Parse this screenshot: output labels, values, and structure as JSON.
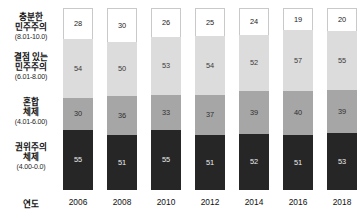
{
  "chart_data": {
    "type": "bar",
    "subtype": "stacked-vertical",
    "title": "",
    "xlabel": "연도",
    "ylabel": "",
    "grid": false,
    "legend_position": "left-axis-labels",
    "axis_title": "연도",
    "categories": [
      "2006",
      "2008",
      "2010",
      "2012",
      "2014",
      "2016",
      "2018"
    ],
    "series": [
      {
        "name": "충분한 민주주의",
        "range_label": "(8.01-10.0)",
        "color": "#ffffff",
        "values": [
          28,
          30,
          26,
          25,
          24,
          19,
          20
        ]
      },
      {
        "name": "결점 있는 민주주의",
        "range_label": "(6.01-8.00)",
        "color": "#dcdcdc",
        "values": [
          54,
          50,
          53,
          54,
          52,
          57,
          55
        ]
      },
      {
        "name": "혼합 체제",
        "range_label": "(4.01-6.00)",
        "color": "#a6a6a6",
        "values": [
          30,
          36,
          33,
          37,
          39,
          40,
          39
        ]
      },
      {
        "name": "권위주의 체제",
        "range_label": "(4.00-0.0)",
        "color": "#262626",
        "values": [
          55,
          51,
          55,
          51,
          52,
          51,
          53
        ]
      }
    ],
    "stack_order_top_to_bottom": [
      "충분한 민주주의",
      "결점 있는 민주주의",
      "혼합 체제",
      "권위주의 체제"
    ],
    "ylim": [
      0,
      167
    ]
  },
  "categories_panel": [
    {
      "name": "충분한",
      "name2": "민주주의",
      "range": "(8.01-10.0)"
    },
    {
      "name": "결점 있는",
      "name2": "민주주의",
      "range": "(6.01-8.00)"
    },
    {
      "name": "혼합",
      "name2": "체제",
      "range": "(4.01-6.00)"
    },
    {
      "name": "권위주의",
      "name2": "체제",
      "range": "(4.00-0.0)"
    }
  ]
}
